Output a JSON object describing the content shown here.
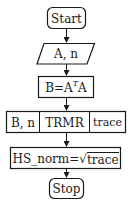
{
  "diagram": {
    "type": "flowchart",
    "nodes": {
      "start": {
        "label": "Start",
        "shape": "rounded-rect"
      },
      "input": {
        "label": "A, n",
        "shape": "parallelogram"
      },
      "compute_b": {
        "label_prefix": "B=A",
        "label_sup": "T",
        "label_suffix": "A",
        "shape": "rect"
      },
      "trmr_call": {
        "shape": "subroutine-row",
        "cells": [
          "B, n",
          "TRMR",
          "trace"
        ]
      },
      "hs_norm": {
        "label_prefix": "HS_norm=",
        "sqrt_symbol": "√",
        "sqrt_arg": "trace",
        "shape": "rect"
      },
      "stop": {
        "label": "Stop",
        "shape": "rounded-rect"
      }
    },
    "edges": [
      [
        "start",
        "input"
      ],
      [
        "input",
        "compute_b"
      ],
      [
        "compute_b",
        "trmr_call"
      ],
      [
        "trmr_call",
        "hs_norm"
      ],
      [
        "hs_norm",
        "stop"
      ]
    ],
    "colors": {
      "stroke": "#1a1a1a",
      "background": "#ffffff"
    }
  }
}
